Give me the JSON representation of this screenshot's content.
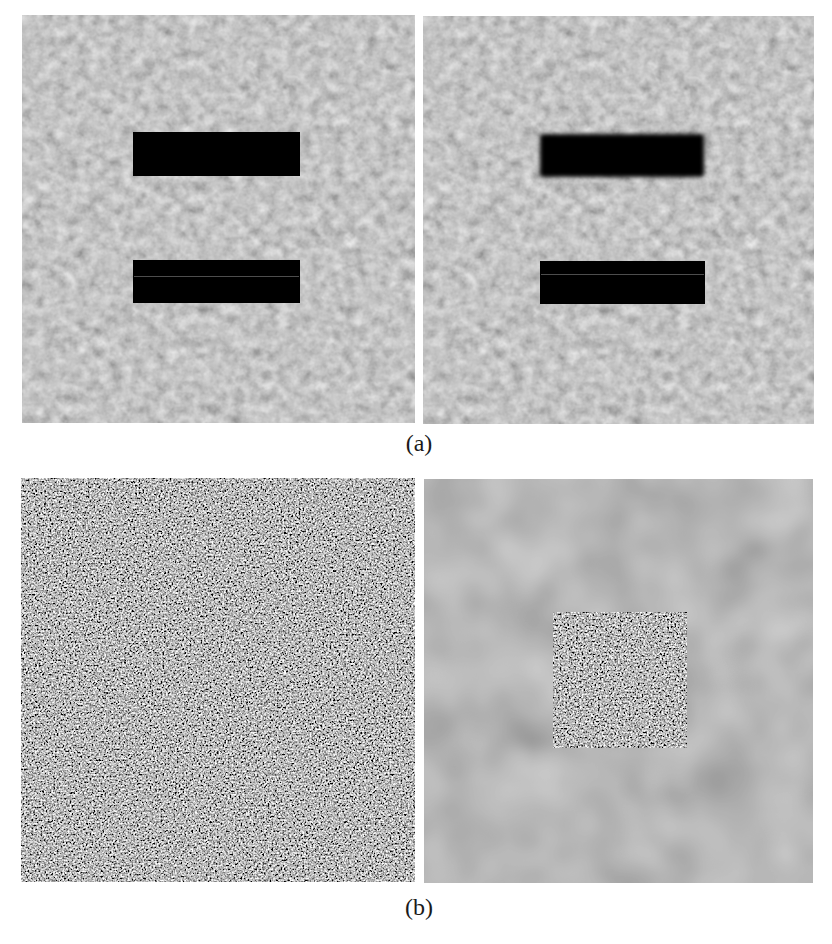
{
  "figure": {
    "subfigures": [
      {
        "caption": "(a)",
        "panels": [
          {
            "id": "a-left",
            "description": "Textured gray background with two sharp black horizontal bars",
            "background_color": "#8c8c8c",
            "bars": [
              {
                "style": "sharp"
              },
              {
                "style": "sharp",
                "has_faint_line": true
              }
            ]
          },
          {
            "id": "a-right",
            "description": "Textured gray background; top bar blurred, bottom bar sharp",
            "background_color": "#8c8c8c",
            "bars": [
              {
                "style": "blurred"
              },
              {
                "style": "sharp",
                "has_faint_line": true
              }
            ]
          }
        ]
      },
      {
        "caption": "(b)",
        "panels": [
          {
            "id": "b-left",
            "description": "Full-frame high-contrast random noise",
            "background_color": "#7f7f7f"
          },
          {
            "id": "b-right",
            "description": "Smooth blurred gray background with sharp noise square in center",
            "background_color": "#7a7a7a",
            "inner_region": "noise-square"
          }
        ]
      }
    ]
  }
}
